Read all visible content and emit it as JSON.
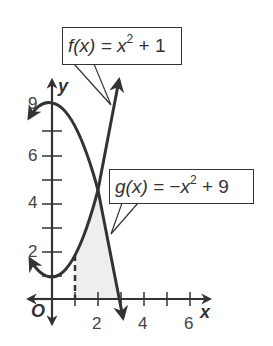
{
  "diagram": {
    "type": "function-graph",
    "axes": {
      "x_label": "x",
      "y_label": "y",
      "origin_label": "O",
      "x_tick_labels": [
        "2",
        "4",
        "6"
      ],
      "y_tick_labels": [
        "2",
        "4",
        "6",
        "9"
      ]
    },
    "functions": [
      {
        "name": "f",
        "label_prefix": "f(x) = x",
        "exponent": "2",
        "label_suffix": " + 1"
      },
      {
        "name": "g",
        "label_prefix": "g(x) = −x",
        "exponent": "2",
        "label_suffix": " + 9"
      }
    ],
    "shaded_region": {
      "from_x": 1,
      "description": "region under the curves from x = 1"
    },
    "dashed_line_x": 1,
    "intersection": {
      "x": 2,
      "y": 5
    },
    "colors": {
      "curve": "#333333",
      "shade": "#eeeeee",
      "axis": "#333333"
    }
  }
}
